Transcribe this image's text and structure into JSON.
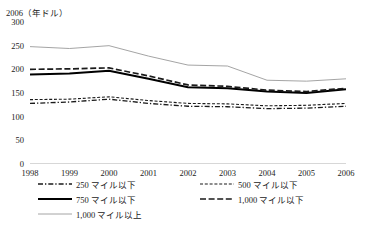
{
  "axis_unit_label": "2006（年ドル）",
  "yaxis": {
    "ticks": [
      "300",
      "250",
      "200",
      "150",
      "100",
      "50",
      "0"
    ],
    "min": 0,
    "max": 300
  },
  "xaxis": {
    "ticks": [
      "1998",
      "1999",
      "2000",
      "2001",
      "2002",
      "2003",
      "2004",
      "2005",
      "2006"
    ]
  },
  "legend": {
    "items": [
      {
        "label": "250 マイル以下",
        "style": "dash-dot",
        "color": "#1a1a1a"
      },
      {
        "label": "500 マイル以下",
        "style": "fine-dash",
        "color": "#1a1a1a"
      },
      {
        "label": "750 マイル以下",
        "style": "thick-solid",
        "color": "#000000"
      },
      {
        "label": "1,000 マイル以下",
        "style": "medium-dash",
        "color": "#1a1a1a"
      },
      {
        "label": "1,000 マイル以上",
        "style": "thin-gray-solid",
        "color": "#9a9a9a"
      }
    ]
  },
  "chart_data": {
    "type": "line",
    "title": "",
    "subtitle": "",
    "xlabel": "",
    "ylabel": "2006（年ドル）",
    "x": [
      1998,
      1999,
      2000,
      2001,
      2002,
      2003,
      2004,
      2005,
      2006
    ],
    "ylim": [
      0,
      300
    ],
    "yticks": [
      0,
      50,
      100,
      150,
      200,
      250,
      300
    ],
    "grid": false,
    "legend_position": "bottom",
    "series": [
      {
        "name": "250 マイル以下",
        "style": "dash-dot",
        "color": "#1a1a1a",
        "values": [
          128,
          131,
          137,
          128,
          122,
          121,
          117,
          118,
          122
        ]
      },
      {
        "name": "500 マイル以下",
        "style": "fine-dash",
        "color": "#1a1a1a",
        "values": [
          136,
          137,
          142,
          134,
          128,
          127,
          123,
          124,
          128
        ]
      },
      {
        "name": "750 マイル以下",
        "style": "thick-solid",
        "color": "#000000",
        "values": [
          189,
          191,
          197,
          180,
          162,
          160,
          153,
          150,
          158
        ]
      },
      {
        "name": "1,000 マイル以下",
        "style": "medium-dash",
        "color": "#1a1a1a",
        "values": [
          200,
          201,
          203,
          186,
          167,
          164,
          156,
          153,
          160
        ]
      },
      {
        "name": "1,000 マイル以上",
        "style": "thin-gray-solid",
        "color": "#9a9a9a",
        "values": [
          248,
          244,
          250,
          228,
          209,
          207,
          177,
          175,
          180
        ]
      }
    ]
  }
}
